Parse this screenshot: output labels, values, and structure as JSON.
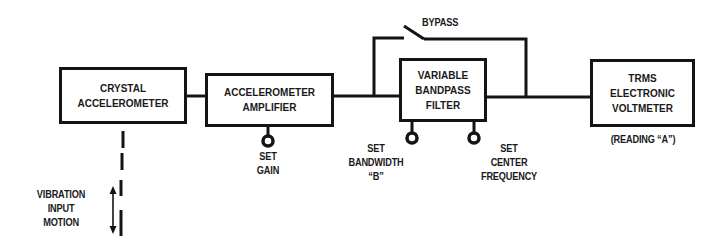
{
  "diagram": {
    "blocks": [
      {
        "id": "crystal-accelerometer",
        "lines": [
          "CRYSTAL",
          "ACCELEROMETER"
        ]
      },
      {
        "id": "accelerometer-amplifier",
        "lines": [
          "ACCELEROMETER",
          "AMPLIFIER"
        ]
      },
      {
        "id": "variable-bandpass-filter",
        "lines": [
          "VARIABLE",
          "BANDPASS",
          "FILTER"
        ]
      },
      {
        "id": "trms-electronic-voltmeter",
        "lines": [
          "TRMS",
          "ELECTRONIC",
          "VOLTMETER"
        ]
      }
    ],
    "bypass_label": "BYPASS",
    "controls": {
      "gain": [
        "SET",
        "GAIN"
      ],
      "bandwidth": [
        "SET",
        "BANDWIDTH",
        "“B”"
      ],
      "center_frequency": [
        "SET",
        "CENTER",
        "FREQUENCY"
      ]
    },
    "reading_label": "(READING “A”)",
    "input_label": [
      "VIBRATION",
      "INPUT",
      "MOTION"
    ],
    "colors": {
      "line": "#141414",
      "background": "#ffffff"
    }
  }
}
